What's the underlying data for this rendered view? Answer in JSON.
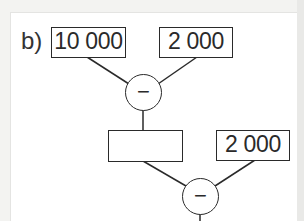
{
  "problem": {
    "label": "b)",
    "top_left_value": "10 000",
    "top_right_value": "2 000",
    "first_operator": "−",
    "intermediate_result": "",
    "second_right_value": "2 000",
    "second_operator": "−"
  },
  "colors": {
    "stroke": "#2a2a2a",
    "background": "#ffffff",
    "page": "#f3f3f1"
  }
}
